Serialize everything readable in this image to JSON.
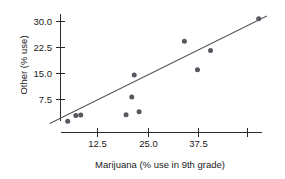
{
  "chart_data": {
    "type": "scatter",
    "title": "",
    "xlabel": "Marijuana (% use in 9th grade)",
    "ylabel": "Other (% use)",
    "xlim": [
      0,
      56
    ],
    "ylim": [
      0,
      33
    ],
    "grid": false,
    "legend": null,
    "xticks": [
      12.5,
      25.0,
      37.5,
      50.0
    ],
    "xtick_labels": [
      "12.5",
      "25.0",
      "37.5",
      ""
    ],
    "yticks": [
      7.5,
      15.0,
      22.5,
      30.0
    ],
    "ytick_labels": [
      "7.5",
      "15.0",
      "22.5",
      "30.0"
    ],
    "points": [
      {
        "x": 5.2,
        "y": 1.2
      },
      {
        "x": 7.2,
        "y": 2.9
      },
      {
        "x": 8.4,
        "y": 3.0
      },
      {
        "x": 19.5,
        "y": 3.1
      },
      {
        "x": 22.7,
        "y": 4.0
      },
      {
        "x": 20.9,
        "y": 8.2
      },
      {
        "x": 21.5,
        "y": 14.6
      },
      {
        "x": 33.8,
        "y": 24.3
      },
      {
        "x": 37.0,
        "y": 16.1
      },
      {
        "x": 40.2,
        "y": 21.6
      },
      {
        "x": 52.0,
        "y": 30.8
      }
    ],
    "fit_line": {
      "type": "linear",
      "x_start": 0.8,
      "y_start": 0.6,
      "x_end": 54.0,
      "y_end": 31.6
    },
    "series_label": "state data",
    "marker": "filled-circle",
    "marker_color": "#55585e",
    "line_color": "#55585e",
    "axis_color": "#2b2b2b"
  }
}
